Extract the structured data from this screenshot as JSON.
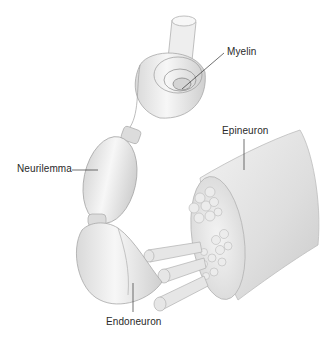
{
  "diagram": {
    "labels": [
      {
        "id": "myelin",
        "text": "Myelin"
      },
      {
        "id": "epineuron",
        "text": "Epineuron"
      },
      {
        "id": "neurilemma",
        "text": "Neurilemma"
      },
      {
        "id": "endoneuron",
        "text": "Endoneuron"
      }
    ]
  }
}
